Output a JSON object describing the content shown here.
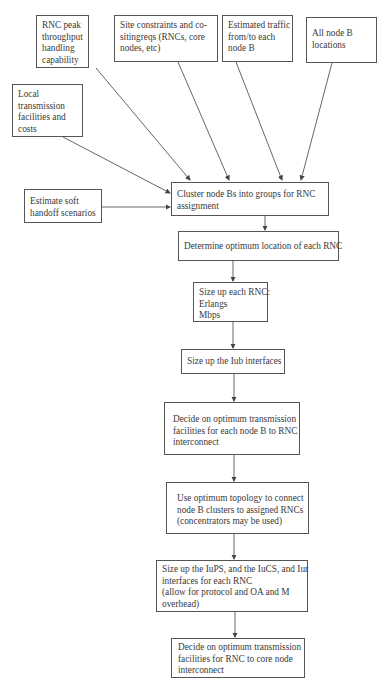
{
  "diagram": {
    "type": "flowchart",
    "inputs": [
      {
        "id": "rnc-peak",
        "lines": [
          "RNC peak",
          "throughput",
          "handling",
          "capability"
        ]
      },
      {
        "id": "site-constraints",
        "lines": [
          "Site constraints and co-",
          "sitingreqs (RNCs, core",
          "nodes, etc)"
        ]
      },
      {
        "id": "estimated-traffic",
        "lines": [
          "Estimated traffic",
          "from/to each",
          "node B"
        ]
      },
      {
        "id": "all-nodeb",
        "lines": [
          "All node B",
          "locations"
        ]
      },
      {
        "id": "local-transmission",
        "lines": [
          "Local",
          "transmission",
          "facilities and",
          "costs"
        ]
      },
      {
        "id": "soft-handoff",
        "lines": [
          "Estimate soft",
          "handoff scenarios"
        ]
      }
    ],
    "steps": [
      {
        "id": "cluster",
        "lines": [
          "Cluster node Bs into groups for RNC",
          "assignment"
        ]
      },
      {
        "id": "determine-location",
        "lines": [
          "Determine optimum location of each RNC"
        ]
      },
      {
        "id": "size-rnc",
        "lines": [
          "Size up each RNC:",
          "Erlangs",
          "Mbps"
        ]
      },
      {
        "id": "size-iub",
        "lines": [
          "Size up the Iub interfaces"
        ]
      },
      {
        "id": "decide-nodeb-rnc",
        "lines": [
          "Decide on optimum transmission",
          "facilities for each node B to RNC",
          "interconnect"
        ]
      },
      {
        "id": "topology",
        "lines": [
          "Use optimum topology to connect",
          "node B clusters to assigned RNCs",
          "(concentrators may be used)"
        ]
      },
      {
        "id": "size-iu",
        "lines": [
          "Size up the IuPS, and the IuCS, and Iur",
          "interfaces for each RNC",
          "(allow for protocol and OA and M",
          "overhead)"
        ]
      },
      {
        "id": "decide-rnc-core",
        "lines": [
          "Decide on optimum transmission",
          "facilities for RNC to core node",
          "interconnect"
        ]
      }
    ],
    "edges": [
      [
        "rnc-peak",
        "cluster"
      ],
      [
        "site-constraints",
        "cluster"
      ],
      [
        "estimated-traffic",
        "cluster"
      ],
      [
        "all-nodeb",
        "cluster"
      ],
      [
        "local-transmission",
        "cluster"
      ],
      [
        "soft-handoff",
        "cluster"
      ],
      [
        "cluster",
        "determine-location"
      ],
      [
        "determine-location",
        "size-rnc"
      ],
      [
        "size-rnc",
        "size-iub"
      ],
      [
        "size-iub",
        "decide-nodeb-rnc"
      ],
      [
        "decide-nodeb-rnc",
        "topology"
      ],
      [
        "topology",
        "size-iu"
      ],
      [
        "size-iu",
        "decide-rnc-core"
      ]
    ],
    "colors": {
      "line": "#555555",
      "text": "#3a3a3a",
      "background": "#ffffff"
    }
  }
}
